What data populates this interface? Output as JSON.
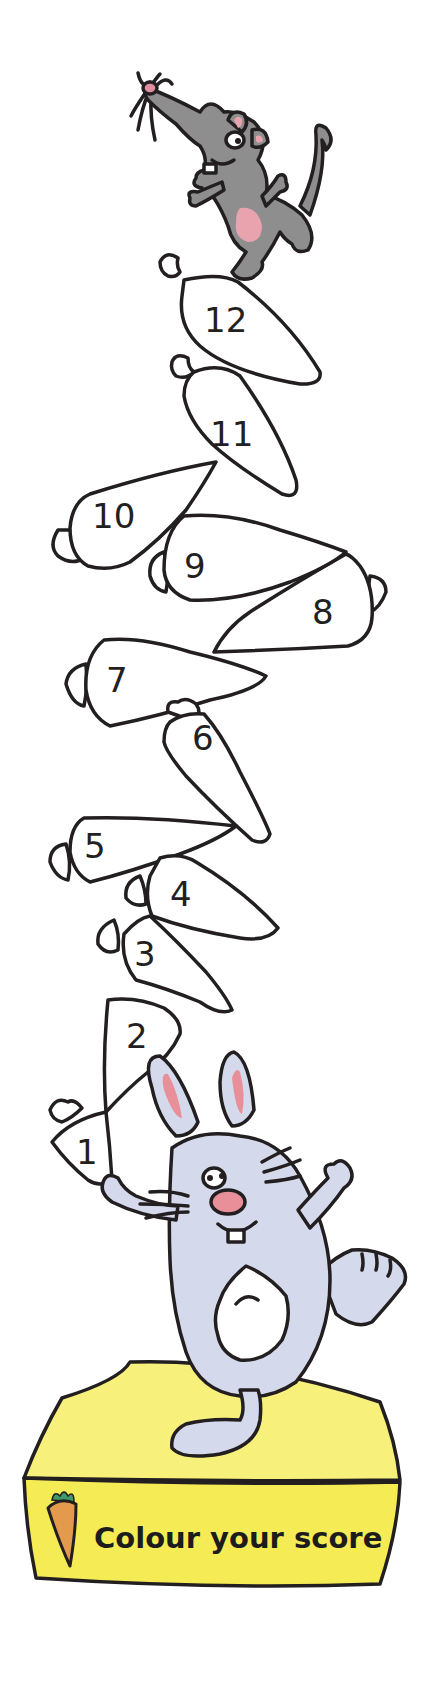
{
  "worksheet": {
    "title": "Colour your score",
    "colors": {
      "outline": "#231f20",
      "carrot_fill": "#ffffff",
      "mouse_body": "#8e8e8e",
      "mouse_pink": "#e8a3ae",
      "rabbit_body": "#d5d9ec",
      "rabbit_pink": "#e88f9a",
      "box_yellow": "#f5ec55",
      "carrot_orange": "#e39a4c",
      "carrot_leaf": "#3f9a6b"
    },
    "carrots": [
      {
        "number": "1"
      },
      {
        "number": "2"
      },
      {
        "number": "3"
      },
      {
        "number": "4"
      },
      {
        "number": "5"
      },
      {
        "number": "6"
      },
      {
        "number": "7"
      },
      {
        "number": "8"
      },
      {
        "number": "9"
      },
      {
        "number": "10"
      },
      {
        "number": "11"
      },
      {
        "number": "12"
      }
    ],
    "characters": {
      "top": "mouse",
      "bottom": "rabbit"
    }
  }
}
